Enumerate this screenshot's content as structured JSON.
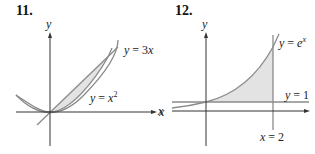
{
  "figures": [
    {
      "number": "11.",
      "axis_x": "x",
      "axis_y": "y",
      "curves": [
        {
          "label_pre": "y = 3",
          "label_var": "x",
          "name": "line-y-3x"
        },
        {
          "label_pre": "y = ",
          "label_var": "x",
          "label_sup": "2",
          "name": "parabola-y-x2"
        }
      ],
      "shaded_region": "between y = x^2 and y = 3x for 0 ≤ x ≤ 3"
    },
    {
      "number": "12.",
      "axis_x": "x",
      "axis_y": "y",
      "curves": [
        {
          "label_pre": "y = ",
          "label_var": "e",
          "label_sup": "x",
          "name": "curve-y-ex"
        },
        {
          "label": "y = 1",
          "name": "line-y-1"
        },
        {
          "label": "x = 2",
          "name": "line-x-2"
        }
      ],
      "shaded_region": "between y = e^x and y = 1 for 0 ≤ x ≤ 2"
    }
  ],
  "colors": {
    "curve": "#8a8a8a",
    "axis": "#333333",
    "shade": "#e3e3e3"
  }
}
